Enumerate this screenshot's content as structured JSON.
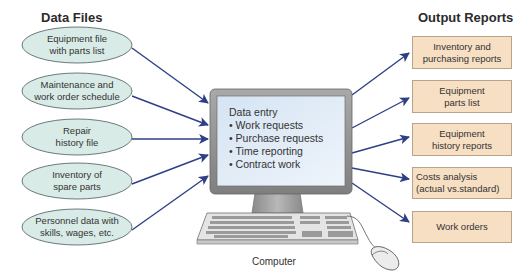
{
  "diagram": {
    "left_title": "Data Files",
    "right_title": "Output Reports",
    "computer_label": "Computer",
    "data_files": [
      {
        "line1": "Equipment file",
        "line2": "with parts list"
      },
      {
        "line1": "Maintenance and",
        "line2": "work order schedule"
      },
      {
        "line1": "Repair",
        "line2": "history file"
      },
      {
        "line1": "Inventory of",
        "line2": "spare parts"
      },
      {
        "line1": "Personnel data with",
        "line2": "skills, wages, etc."
      }
    ],
    "screen": {
      "heading": "Data entry",
      "items": [
        "Work requests",
        "Purchase requests",
        "Time reporting",
        "Contract work"
      ]
    },
    "output_reports": [
      {
        "line1": "Inventory and",
        "line2": "purchasing reports"
      },
      {
        "line1": "Equipment",
        "line2": "parts list"
      },
      {
        "line1": "Equipment",
        "line2": "history reports"
      },
      {
        "line1": "Costs analysis",
        "line2": "(actual vs.standard)"
      },
      {
        "line1": "Work orders",
        "line2": ""
      }
    ],
    "colors": {
      "ellipse_fill": "#d9ebe6",
      "ellipse_stroke": "#5c6b70",
      "box_fill": "#f7dfc3",
      "box_stroke": "#b9a48b",
      "arrow": "#2f3f86",
      "screen": "#e3eef8",
      "monitor_frame": "#8f8f8f"
    }
  }
}
